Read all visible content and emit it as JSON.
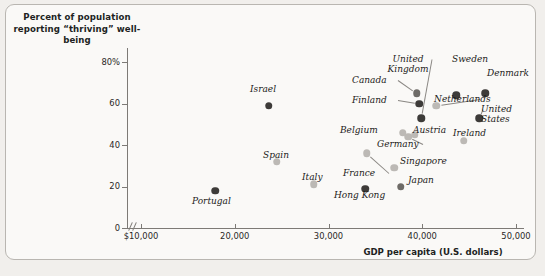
{
  "chart_data": {
    "type": "scatter",
    "title": "",
    "ylabel": "Percent of population reporting “thriving” well-being",
    "xlabel": "GDP per capita (U.S. dollars)",
    "xlim": [
      10000,
      50000
    ],
    "ylim": [
      0,
      85
    ],
    "grid": false,
    "legend": "none",
    "axis_break_x": true,
    "ytick_labels": [
      "0",
      "20",
      "40",
      "60",
      "80%"
    ],
    "ytick_values": [
      0,
      20,
      40,
      60,
      80
    ],
    "xtick_labels": [
      "$10,000",
      "20,000",
      "30,000",
      "40,000",
      "50,000"
    ],
    "xtick_values": [
      10000,
      20000,
      30000,
      40000,
      50000
    ],
    "points": [
      {
        "label": "Portugal",
        "x": 17900,
        "y": 18,
        "shade": "dark",
        "lx": 192,
        "ly": 196,
        "leader": false
      },
      {
        "label": "Israel",
        "x": 23600,
        "y": 59,
        "shade": "dark",
        "lx": 250,
        "ly": 84,
        "leader": false
      },
      {
        "label": "Spain",
        "x": 24500,
        "y": 32,
        "shade": "light",
        "lx": 263,
        "ly": 150,
        "leader": false
      },
      {
        "label": "Italy",
        "x": 28400,
        "y": 21,
        "shade": "light",
        "lx": 302,
        "ly": 172,
        "leader": false
      },
      {
        "label": "Hong Kong",
        "x": 33900,
        "y": 19,
        "shade": "dark",
        "lx": 334,
        "ly": 190,
        "leader": false
      },
      {
        "label": "France",
        "x": 34100,
        "y": 36,
        "shade": "light",
        "lx": 343,
        "ly": 168,
        "leader": true
      },
      {
        "label": "Singapore",
        "x": 37000,
        "y": 29,
        "shade": "light",
        "lx": 400,
        "ly": 156,
        "leader": false
      },
      {
        "label": "Japan",
        "x": 37700,
        "y": 20,
        "shade": "medium",
        "lx": 408,
        "ly": 175,
        "leader": false
      },
      {
        "label": "Germany",
        "x": 38500,
        "y": 44,
        "shade": "light",
        "lx": 377,
        "ly": 139,
        "leader": true
      },
      {
        "label": "Belgium",
        "x": 37900,
        "y": 46,
        "shade": "light",
        "lx": 340,
        "ly": 125,
        "leader": false
      },
      {
        "label": "Austria",
        "x": 39200,
        "y": 45,
        "shade": "light",
        "lx": 413,
        "ly": 125,
        "leader": false
      },
      {
        "label": "Canada",
        "x": 39400,
        "y": 65,
        "shade": "medium",
        "lx": 352,
        "ly": 75,
        "leader": true
      },
      {
        "label": "Finland",
        "x": 39700,
        "y": 60,
        "shade": "dark",
        "lx": 352,
        "ly": 95,
        "leader": true
      },
      {
        "label": "United Kingdom",
        "x": 39900,
        "y": 53,
        "shade": "dark",
        "lx": 386,
        "ly": 54,
        "leader": true
      },
      {
        "label": "Netherlands",
        "x": 41500,
        "y": 59,
        "shade": "light",
        "lx": 434,
        "ly": 94,
        "leader": true
      },
      {
        "label": "Sweden",
        "x": 43600,
        "y": 64,
        "shade": "dark",
        "lx": 452,
        "ly": 54,
        "leader": false
      },
      {
        "label": "Ireland",
        "x": 44400,
        "y": 42,
        "shade": "light",
        "lx": 453,
        "ly": 128,
        "leader": false
      },
      {
        "label": "United States",
        "x": 46100,
        "y": 53,
        "shade": "dark",
        "lx": 481,
        "ly": 104,
        "leader": true
      },
      {
        "label": "Denmark",
        "x": 46700,
        "y": 65,
        "shade": "dark",
        "lx": 487,
        "ly": 68,
        "leader": false
      }
    ]
  }
}
